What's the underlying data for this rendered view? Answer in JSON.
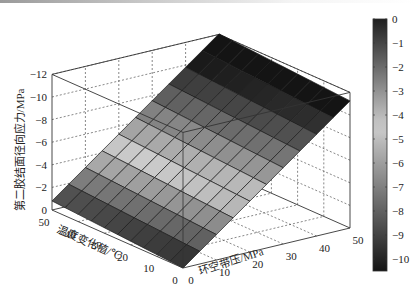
{
  "chart_data": {
    "type": "surface3d",
    "title": "",
    "xlabel": "环空带压/MPa",
    "ylabel": "温度变化值/℃",
    "zlabel": "第二胶结面径向应力/MPa",
    "x_ticks": [
      "0",
      "10",
      "20",
      "30",
      "40",
      "50"
    ],
    "y_ticks": [
      "0",
      "10",
      "20",
      "30",
      "40",
      "50"
    ],
    "z_ticks": [
      "0",
      "-2",
      "-4",
      "-6",
      "-8",
      "-10",
      "-12"
    ],
    "xlim": [
      0,
      50
    ],
    "ylim": [
      0,
      50
    ],
    "zlim": [
      -12,
      0
    ],
    "grid": true,
    "colormap": "gray (dark at extremes, light in middle)",
    "grid_x": [
      0,
      5,
      10,
      15,
      20,
      25,
      30,
      35,
      40,
      45,
      50
    ],
    "grid_y": [
      0,
      5,
      10,
      15,
      20,
      25,
      30,
      35,
      40,
      45,
      50
    ],
    "z_model": "z ≈ -0.225·x - 0.016·y",
    "colorbar": {
      "ticks": [
        "0",
        "-1",
        "-2",
        "-3",
        "-4",
        "-5",
        "-6",
        "-7",
        "-8",
        "-9",
        "-10"
      ],
      "range": [
        -10.5,
        0
      ],
      "position": "right"
    }
  }
}
